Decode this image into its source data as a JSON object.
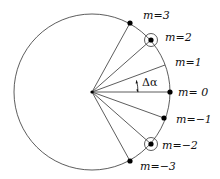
{
  "diagram": {
    "title": "",
    "colors": {
      "line": "#333333",
      "dot": "#000000",
      "background": "#ffffff"
    },
    "center": {
      "x": 92,
      "y": 92
    },
    "circle_radius": 78,
    "angle_label": "Δα",
    "orders": [
      {
        "label": "m=3",
        "x": 130,
        "y": 23,
        "dot": true,
        "ring": false,
        "lx": 143,
        "ly": 19
      },
      {
        "label": "m=2",
        "x": 151,
        "y": 40,
        "dot": true,
        "ring": true,
        "lx": 165,
        "ly": 41
      },
      {
        "label": "m=1",
        "x": 165,
        "y": 65,
        "dot": false,
        "ring": false,
        "lx": 175,
        "ly": 66
      },
      {
        "label": "m=  0",
        "x": 170,
        "y": 92,
        "dot": true,
        "ring": false,
        "lx": 178,
        "ly": 96
      },
      {
        "label": "m=−1",
        "x": 164,
        "y": 118,
        "dot": true,
        "ring": false,
        "lx": 176,
        "ly": 123
      },
      {
        "label": "m=−2",
        "x": 151,
        "y": 144,
        "dot": true,
        "ring": true,
        "lx": 162,
        "ly": 149
      },
      {
        "label": "m=−3",
        "x": 130,
        "y": 161,
        "dot": true,
        "ring": false,
        "lx": 140,
        "ly": 170
      }
    ]
  }
}
